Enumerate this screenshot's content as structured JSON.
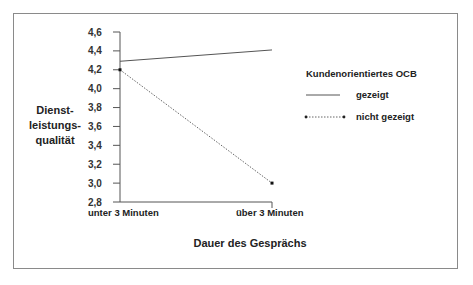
{
  "chart_data": {
    "type": "line",
    "title": "",
    "xlabel": "Dauer des Gesprächs",
    "ylabel": [
      "Dienst-",
      "leistungs-",
      "qualität"
    ],
    "categories": [
      "unter 3 Minuten",
      "über 3 Minuten"
    ],
    "yticks": [
      "4,6",
      "4,4",
      "4,2",
      "4,0",
      "3,8",
      "3,6",
      "3,4",
      "3,2",
      "3,0",
      "2,8"
    ],
    "ylim": [
      2.8,
      4.6
    ],
    "grid": false,
    "legend": {
      "title": "Kundenorientiertes OCB",
      "position": "right",
      "entries": [
        "gezeigt",
        "nicht gezeigt"
      ]
    },
    "series": [
      {
        "name": "gezeigt",
        "style": "solid",
        "values": [
          4.29,
          4.41
        ]
      },
      {
        "name": "nicht gezeigt",
        "style": "dotted-with-markers",
        "values": [
          4.2,
          3.0
        ]
      }
    ]
  },
  "colors": {
    "line": "#555555",
    "frame": "#8a8a8a",
    "text": "#222222"
  }
}
